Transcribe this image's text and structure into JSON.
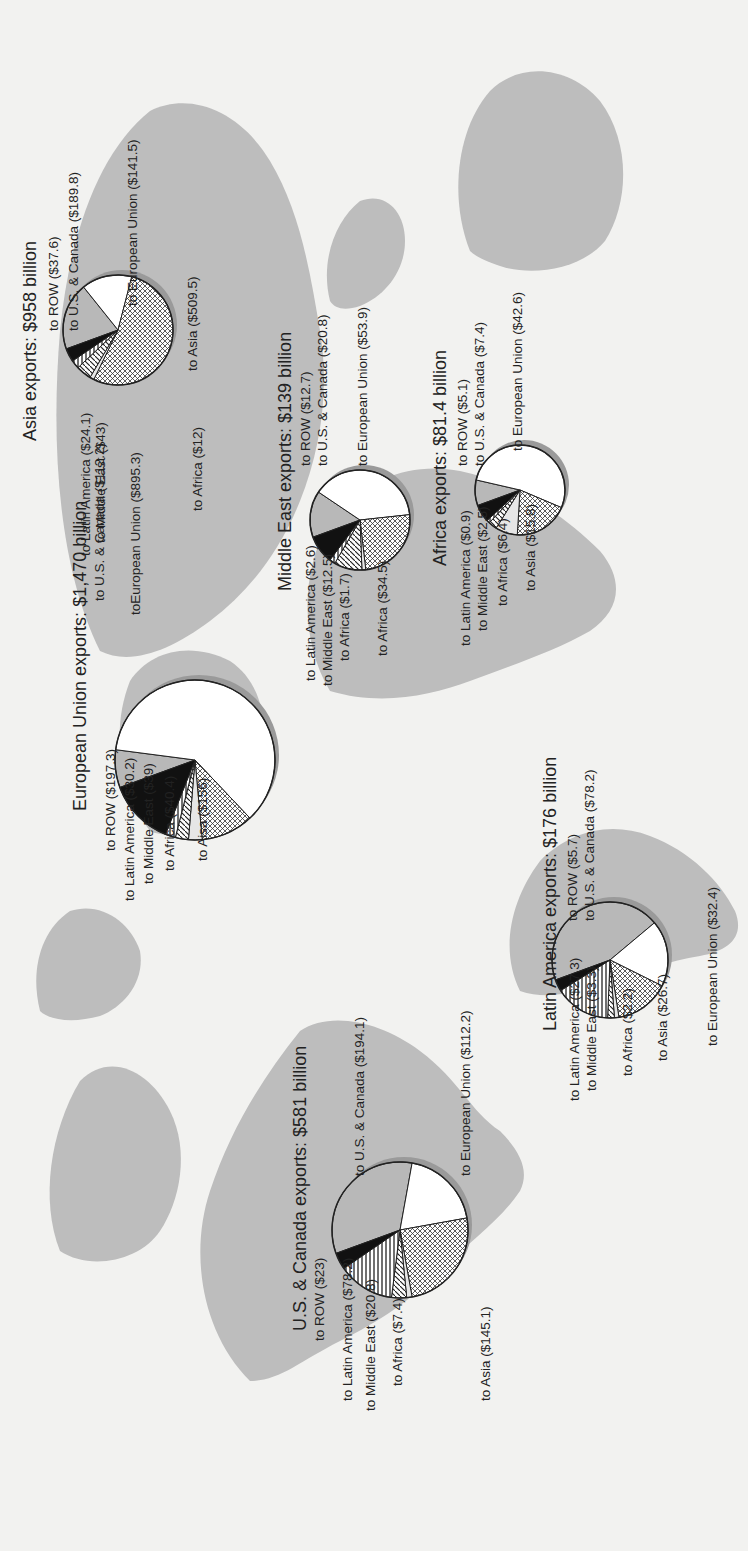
{
  "figure": {
    "orientation": "rotated 90 degrees counter-clockwise"
  },
  "colors": {
    "background": "#f2f2f0",
    "land": "#bdbdbd",
    "pie_outline": "#222222",
    "slice_ROW": "#111111",
    "slice_US_Canada": "#b8b8b8",
    "slice_EU": "#ffffff",
    "slice_Asia": "crosshatch",
    "slice_Africa": "#e6e6e6",
    "slice_MiddleEast": "diagonal-hatch",
    "slice_LatinAmerica": "horizontal-stripe"
  },
  "regions": {
    "asia": {
      "title": "Asia exports: $958 billion",
      "labels": {
        "row": "to ROW ($37.6)",
        "us_canada": "to U.S. & Canada ($189.8)",
        "eu": "to European Union ($141.5)",
        "asia": "to Asia ($509.5)",
        "africa": "to Africa ($12)",
        "middle_east": "to Middle East ($43)",
        "latin_america": "to Latin America ($24.1)"
      }
    },
    "eu": {
      "title": "European Union exports: $1,470 billion",
      "labels": {
        "us_canada": "to U.S. & Canada ($112.2)",
        "eu": "toEuropean Union ($895.3)",
        "row": "to ROW ($197.3)",
        "latin_america": "to Latin America ($30.2)",
        "middle_east": "to Middle East ($39)",
        "africa": "to Africa ($40.4)",
        "asia": "to Aisa ($156)"
      }
    },
    "middle_east": {
      "title": "Middle East exports: $139 billion",
      "labels": {
        "row": "to ROW ($12.7)",
        "us_canada": "to U.S. & Canada ($20.8)",
        "eu": "to European Union ($53.9)",
        "latin_america": "to Latin America ($2.6)",
        "middle_east": "to Middle East ($12.5)",
        "africa": "to Africa ($1.7)",
        "asia": "to Africa ($34.5)"
      }
    },
    "africa": {
      "title": "Africa exports: $81.4 billion",
      "labels": {
        "row": "to ROW ($5.1)",
        "us_canada": "to U.S. & Canada ($7.4)",
        "eu": "to European Union ($42.6)",
        "latin_america": "to Latin America ($0.9)",
        "middle_east": "to Middle East ($2.5)",
        "africa": "to Africa ($6.4)",
        "asia": "to Asia ($15.8)"
      }
    },
    "latin_america": {
      "title": "Latin America exports: $176 billion",
      "labels": {
        "row": "to ROW ($5.7)",
        "us_canada": "to U.S. & Canada ($78.2)",
        "eu": "to European Union ($32.4)",
        "latin_america": "to Latin America ($27.3)",
        "middle_east": "to Middle East ($3.3)",
        "africa": "to Africa ($2.2)",
        "asia": "to Asia ($26.7)"
      }
    },
    "us_canada": {
      "title": "U.S. & Canada exports: $581 billion",
      "labels": {
        "us_canada": "to U.S. & Canada ($194.1)",
        "eu": "to European Union ($112.2)",
        "row": "to ROW ($23)",
        "latin_america": "to Latin America ($78.2)",
        "middle_east": "to Middle East ($20.8)",
        "africa": "to Africa ($7.4)",
        "asia": "to Asia ($145.1)"
      }
    }
  },
  "chart_data": {
    "type": "pie",
    "units": "billion USD",
    "destinations": [
      "ROW",
      "U.S. & Canada",
      "European Union",
      "Asia",
      "Africa",
      "Middle East",
      "Latin America"
    ],
    "series": [
      {
        "name": "Asia",
        "total": 958,
        "values": {
          "ROW": 37.6,
          "U.S. & Canada": 189.8,
          "European Union": 141.5,
          "Asia": 509.5,
          "Africa": 12,
          "Middle East": 43,
          "Latin America": 24.1
        }
      },
      {
        "name": "European Union",
        "total": 1470,
        "values": {
          "ROW": 197.3,
          "U.S. & Canada": 112.2,
          "European Union": 895.3,
          "Asia": 156,
          "Africa": 40.4,
          "Middle East": 39,
          "Latin America": 30.2
        }
      },
      {
        "name": "Middle East",
        "total": 139,
        "values": {
          "ROW": 12.7,
          "U.S. & Canada": 20.8,
          "European Union": 53.9,
          "Asia": 34.5,
          "Africa": 1.7,
          "Middle East": 12.5,
          "Latin America": 2.6
        }
      },
      {
        "name": "Africa",
        "total": 81.4,
        "values": {
          "ROW": 5.1,
          "U.S. & Canada": 7.4,
          "European Union": 42.6,
          "Asia": 15.8,
          "Africa": 6.4,
          "Middle East": 2.5,
          "Latin America": 0.9
        }
      },
      {
        "name": "Latin America",
        "total": 176,
        "values": {
          "ROW": 5.7,
          "U.S. & Canada": 78.2,
          "European Union": 32.4,
          "Asia": 26.7,
          "Africa": 2.2,
          "Middle East": 3.3,
          "Latin America": 27.3
        }
      },
      {
        "name": "U.S. & Canada",
        "total": 581,
        "values": {
          "ROW": 23,
          "U.S. & Canada": 194.1,
          "European Union": 112.2,
          "Asia": 145.1,
          "Africa": 7.4,
          "Middle East": 20.8,
          "Latin America": 78.2
        }
      }
    ],
    "legend": "none (slices labeled directly with leader lines)"
  }
}
